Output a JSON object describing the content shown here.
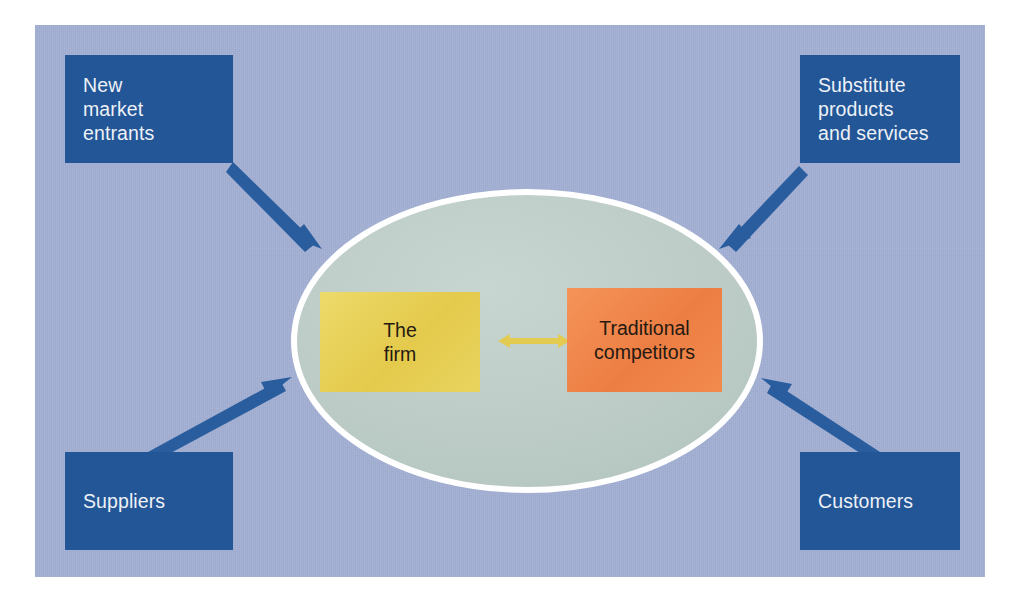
{
  "diagram": {
    "panel_color": "#a3b0d4",
    "ellipse_color": "#bdcdc8",
    "ellipse_stroke": "#ffffff",
    "arrow_color": "#2a5d9e",
    "forces": [
      {
        "id": "new-market-entrants",
        "label": "New\nmarket\nentrants",
        "color": "#235696",
        "position": "top-left",
        "arrow_direction": "toward-firm"
      },
      {
        "id": "substitute-products-and-services",
        "label": "Substitute\nproducts\nand services",
        "color": "#235696",
        "position": "top-right",
        "arrow_direction": "toward-firm"
      },
      {
        "id": "suppliers",
        "label": "Suppliers",
        "color": "#235696",
        "position": "bottom-left",
        "arrow_direction": "toward-firm"
      },
      {
        "id": "customers",
        "label": "Customers",
        "color": "#235696",
        "position": "bottom-right",
        "arrow_direction": "toward-firm"
      }
    ],
    "core": {
      "firm": {
        "label": "The\nfirm",
        "color": "#e8d259"
      },
      "competitors": {
        "label": "Traditional\ncompetitors",
        "color": "#f0854a"
      },
      "connector": {
        "style": "double-headed-arrow",
        "color": "#e8d259"
      }
    }
  }
}
